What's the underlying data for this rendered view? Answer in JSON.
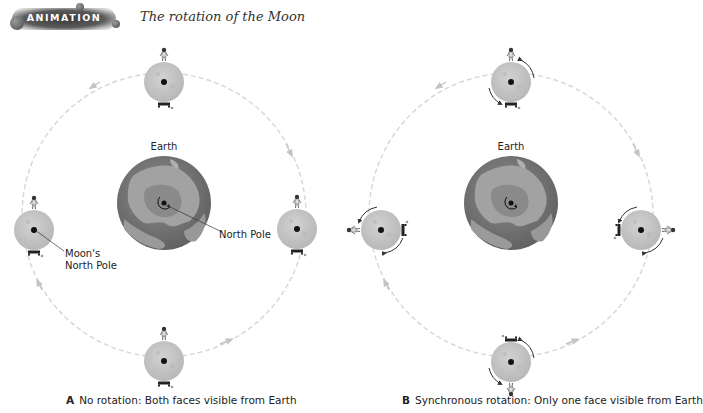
{
  "header": {
    "badge_label": "ANIMATION",
    "title": "The rotation of the Moon"
  },
  "panels": [
    {
      "id": "A",
      "earth_label": "Earth",
      "north_pole_label": "North Pole",
      "moon_pole_label_line1": "Moon's",
      "moon_pole_label_line2": "North Pole",
      "caption_letter": "A",
      "caption_text": "No rotation:  Both faces visible from Earth"
    },
    {
      "id": "B",
      "earth_label": "Earth",
      "caption_letter": "B",
      "caption_text": "Synchronous rotation:  Only one face visible from Earth"
    }
  ],
  "colors": {
    "earth_ocean": "#7a7a7a",
    "earth_land": "#9c9c9c",
    "moon": "#c8c8c8",
    "orbit": "#d0d0d0",
    "arrow": "#333333"
  }
}
